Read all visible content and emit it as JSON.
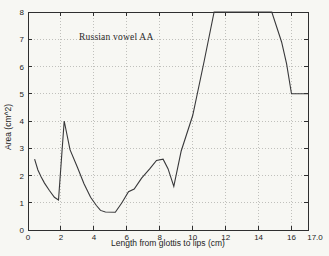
{
  "chart_data": {
    "type": "line",
    "title": "Russian vowel AA",
    "xlabel": "Length from glottis to lips (cm)",
    "ylabel": "Area (cm^2)",
    "xlim": [
      0,
      17
    ],
    "ylim": [
      0,
      8
    ],
    "x_ticks": [
      0,
      2,
      4,
      6,
      8,
      10,
      12,
      14,
      16
    ],
    "x_end_label": "17.0",
    "y_ticks": [
      0,
      1,
      2,
      3,
      4,
      5,
      6,
      7,
      8
    ],
    "grid": true,
    "legend": "none",
    "colors": {
      "line": "#38383a",
      "axis": "#2f2f2f",
      "grid": "#b2b2ae",
      "text": "#242424",
      "background": "#f7f7f3"
    },
    "series": [
      {
        "name": "area-function",
        "points": [
          [
            0.4,
            2.6
          ],
          [
            0.6,
            2.2
          ],
          [
            0.8,
            1.95
          ],
          [
            1.0,
            1.72
          ],
          [
            1.3,
            1.45
          ],
          [
            1.6,
            1.2
          ],
          [
            1.85,
            1.1
          ],
          [
            2.2,
            4.0
          ],
          [
            2.55,
            2.95
          ],
          [
            3.0,
            2.3
          ],
          [
            3.4,
            1.7
          ],
          [
            3.8,
            1.2
          ],
          [
            4.15,
            0.9
          ],
          [
            4.4,
            0.72
          ],
          [
            4.7,
            0.66
          ],
          [
            5.3,
            0.65
          ],
          [
            5.7,
            1.0
          ],
          [
            6.1,
            1.4
          ],
          [
            6.45,
            1.5
          ],
          [
            6.9,
            1.9
          ],
          [
            7.4,
            2.25
          ],
          [
            7.8,
            2.55
          ],
          [
            8.2,
            2.6
          ],
          [
            8.5,
            2.25
          ],
          [
            8.85,
            1.6
          ],
          [
            9.3,
            2.9
          ],
          [
            10.0,
            4.2
          ],
          [
            10.7,
            6.2
          ],
          [
            11.3,
            8.0
          ],
          [
            14.8,
            8.0
          ],
          [
            15.4,
            6.9
          ],
          [
            15.7,
            6.1
          ],
          [
            16.0,
            5.0
          ],
          [
            17.0,
            5.0
          ]
        ]
      }
    ]
  }
}
